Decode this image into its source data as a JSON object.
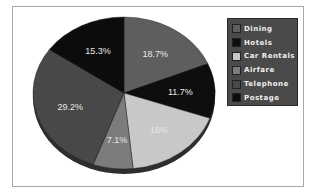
{
  "chart_data": {
    "type": "pie",
    "title": "",
    "start_angle_deg": 0,
    "direction": "clockwise",
    "slices": [
      {
        "label": "Dining",
        "value": 18.7,
        "display": "18.7%",
        "color": "#5e5e5e"
      },
      {
        "label": "Hotels",
        "value": 11.7,
        "display": "11.7%",
        "color": "#0e0e0e"
      },
      {
        "label": "Car Rentals",
        "value": 18.0,
        "display": "18%",
        "color": "#c8c8c8"
      },
      {
        "label": "Airfare",
        "value": 7.1,
        "display": "7.1%",
        "color": "#7c7c7c"
      },
      {
        "label": "Telephone",
        "value": 29.2,
        "display": "29.2%",
        "color": "#484848"
      },
      {
        "label": "Postage",
        "value": 15.3,
        "display": "15.3%",
        "color": "#0c0c0c"
      }
    ],
    "legend": {
      "position": "right",
      "entries": [
        "Dining",
        "Hotels",
        "Car Rentals",
        "Airfare",
        "Telephone",
        "Postage"
      ]
    },
    "style": {
      "three_d": true,
      "depth_color": "#2e2e2e"
    }
  }
}
